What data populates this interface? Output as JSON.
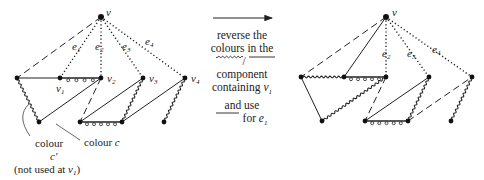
{
  "figure": {
    "left_graph": {
      "vertices": [
        {
          "id": "v",
          "label": "v"
        },
        {
          "id": "A",
          "label": ""
        },
        {
          "id": "v1",
          "label": "v1"
        },
        {
          "id": "v2",
          "label": "v2"
        },
        {
          "id": "v3",
          "label": "v3"
        },
        {
          "id": "v4",
          "label": "v4"
        },
        {
          "id": "B",
          "label": ""
        },
        {
          "id": "C",
          "label": ""
        },
        {
          "id": "D",
          "label": ""
        },
        {
          "id": "E",
          "label": ""
        }
      ],
      "edges": [
        {
          "from": "v",
          "to": "A",
          "style": "dashed"
        },
        {
          "from": "v",
          "to": "v1",
          "style": "dotted",
          "label": "e1"
        },
        {
          "from": "v",
          "to": "v2",
          "style": "dotted",
          "label": "e2"
        },
        {
          "from": "v",
          "to": "v3",
          "style": "dotted",
          "label": "e3"
        },
        {
          "from": "v",
          "to": "v4",
          "style": "dotted",
          "label": "e4"
        },
        {
          "from": "A",
          "to": "v1",
          "style": "solid"
        },
        {
          "from": "v1",
          "to": "v2",
          "style": "beaded"
        },
        {
          "from": "A",
          "to": "B",
          "style": "wavy"
        },
        {
          "from": "B",
          "to": "v2",
          "style": "solid"
        },
        {
          "from": "v2",
          "to": "C",
          "style": "dashed"
        },
        {
          "from": "C",
          "to": "D",
          "style": "beaded"
        },
        {
          "from": "C",
          "to": "v3",
          "style": "solid"
        },
        {
          "from": "D",
          "to": "v3",
          "style": "wavy"
        },
        {
          "from": "D",
          "to": "v4",
          "style": "solid"
        },
        {
          "from": "E",
          "to": "v4",
          "style": "wavy"
        }
      ],
      "annotations": {
        "colour_c_prime": [
          "colour",
          "c′",
          "(not used at v₁)"
        ],
        "colour_c": "colour c"
      }
    },
    "transition": {
      "arrow": "right-arrow",
      "lines": [
        "reverse the",
        "colours in the",
        "/",
        "component",
        "containing v₁",
        "and use",
        "for e₁"
      ]
    },
    "right_graph": {
      "vertices": [
        {
          "id": "v",
          "label": "v"
        },
        {
          "id": "A",
          "label": ""
        },
        {
          "id": "v1",
          "label": ""
        },
        {
          "id": "v2",
          "label": ""
        },
        {
          "id": "v3",
          "label": ""
        },
        {
          "id": "v4",
          "label": ""
        },
        {
          "id": "B",
          "label": ""
        },
        {
          "id": "C",
          "label": ""
        },
        {
          "id": "D",
          "label": ""
        },
        {
          "id": "E",
          "label": ""
        }
      ],
      "edges": [
        {
          "from": "v",
          "to": "A",
          "style": "dashed"
        },
        {
          "from": "v",
          "to": "v1",
          "style": "solid"
        },
        {
          "from": "v",
          "to": "v2",
          "style": "dotted",
          "label": "e2"
        },
        {
          "from": "v",
          "to": "v3",
          "style": "dotted",
          "label": "e3"
        },
        {
          "from": "v",
          "to": "v4",
          "style": "dotted",
          "label": "e4"
        },
        {
          "from": "A",
          "to": "v1",
          "style": "wavy"
        },
        {
          "from": "v1",
          "to": "v2",
          "style": "beaded"
        },
        {
          "from": "A",
          "to": "B",
          "style": "solid"
        },
        {
          "from": "B",
          "to": "v2",
          "style": "wavy"
        },
        {
          "from": "v2",
          "to": "C",
          "style": "dashed"
        },
        {
          "from": "C",
          "to": "D",
          "style": "beaded"
        },
        {
          "from": "C",
          "to": "v3",
          "style": "solid"
        },
        {
          "from": "D",
          "to": "v3",
          "style": "wavy"
        },
        {
          "from": "D",
          "to": "v4",
          "style": "dashed"
        },
        {
          "from": "E",
          "to": "v4",
          "style": "wavy"
        }
      ]
    }
  },
  "labels": {
    "v": "v",
    "v1": "v",
    "v1_sub": "1",
    "v2": "v",
    "v2_sub": "2",
    "v3": "v",
    "v3_sub": "3",
    "v4": "v",
    "v4_sub": "4",
    "e1": "e",
    "e1_sub": "1",
    "e2": "e",
    "e2_sub": "2",
    "e3": "e",
    "e3_sub": "3",
    "e4": "e",
    "e4_sub": "4",
    "cap_colour": "colour",
    "cap_cprime": "c′",
    "cap_not_used": "(not used at ",
    "cap_v": "v",
    "cap_v_sub": "1",
    "cap_close": ")",
    "cap_colour_c": "colour ",
    "cap_c": "c",
    "mid_line1": "reverse the",
    "mid_line2": "colours in the",
    "mid_slash": "/",
    "mid_line4": "component",
    "mid_line5a": "containing ",
    "mid_line5v": "v",
    "mid_line5sub": "1",
    "mid_line6": "and use",
    "mid_line7a": "for ",
    "mid_line7e": "e",
    "mid_line7sub": "1"
  }
}
